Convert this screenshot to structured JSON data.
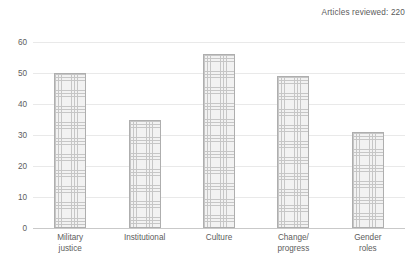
{
  "annotation": {
    "text": "Articles reviewed: 220"
  },
  "chart_data": {
    "type": "bar",
    "title": "",
    "subtitle": "",
    "xlabel": "",
    "ylabel": "",
    "categories": [
      "Military\njustice",
      "Institutional",
      "Culture",
      "Change/\nprogress",
      "Gender\nroles"
    ],
    "values": [
      50,
      35,
      56,
      49,
      31
    ],
    "ylim": [
      0,
      60
    ],
    "yticks": [
      0,
      10,
      20,
      30,
      40,
      50,
      60
    ],
    "ytick_labels": [
      "0",
      "10",
      "20",
      "30",
      "40",
      "50",
      "60"
    ],
    "grid": "horizontal",
    "legend": "none",
    "annotations": [
      "Articles reviewed: 220"
    ],
    "series": [
      {
        "name": "Articles",
        "values": [
          50,
          35,
          56,
          49,
          31
        ]
      }
    ]
  },
  "style": {
    "bar_fill": "#f2f2f2",
    "bar_hatch": "#c6c6c6",
    "bar_border": "#aeaeae",
    "gridline": "#e9e9e9",
    "axis": "#c9c9c9",
    "text": "#5d5d5d",
    "background": "#ffffff"
  }
}
